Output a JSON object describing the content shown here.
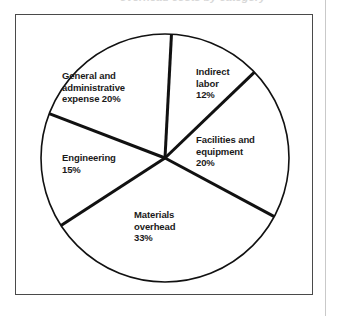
{
  "figure": {
    "title_fragment": "overhead costs by category",
    "frame_color": "#4a4a4a",
    "background_color": "#ffffff",
    "line_color": "#111111"
  },
  "chart_data": {
    "type": "pie",
    "title": "",
    "xlabel": "",
    "ylabel": "",
    "legend_position": "none",
    "grid": false,
    "total": 100,
    "unit": "%",
    "categories": [
      "Indirect labor",
      "Facilities and equipment",
      "Materials overhead",
      "Engineering",
      "General and administrative expense"
    ],
    "values": [
      12,
      20,
      33,
      15,
      20
    ],
    "start_angle_deg": 3,
    "direction": "clockwise",
    "slices": [
      {
        "name": "indirect-labor",
        "label": "Indirect\nlabor\n12%",
        "label_name": "Indirect labor",
        "value": 12,
        "value_text": "12%",
        "start_deg": 3,
        "end_deg": 46.2,
        "color": "#ffffff"
      },
      {
        "name": "facilities-and-equipment",
        "label": "Facilities and\nequipment\n20%",
        "label_name": "Facilities and equipment",
        "value": 20,
        "value_text": "20%",
        "start_deg": 46.2,
        "end_deg": 118.2,
        "color": "#ffffff"
      },
      {
        "name": "materials-overhead",
        "label": "Materials\noverhead\n33%",
        "label_name": "Materials overhead",
        "value": 33,
        "value_text": "33%",
        "start_deg": 118.2,
        "end_deg": 237,
        "color": "#ffffff"
      },
      {
        "name": "engineering",
        "label": "Engineering\n15%",
        "label_name": "Engineering",
        "value": 15,
        "value_text": "15%",
        "start_deg": 237,
        "end_deg": 291,
        "color": "#ffffff"
      },
      {
        "name": "general-and-administrative-expense",
        "label": "General and\nadministrative\nexpense 20%",
        "label_name": "General and administrative expense",
        "value": 20,
        "value_text": "20%",
        "start_deg": 291,
        "end_deg": 363,
        "color": "#ffffff"
      }
    ]
  }
}
